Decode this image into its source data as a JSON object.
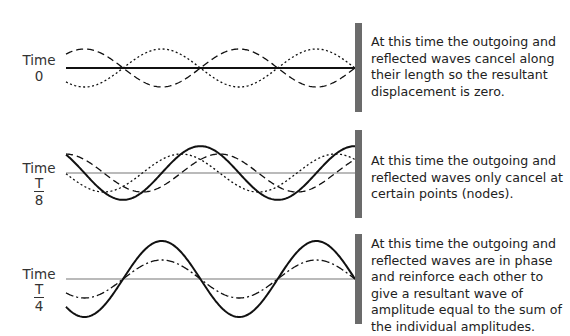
{
  "diagram": {
    "colors": {
      "wall": "#6b6b6b",
      "line": "#111111",
      "axis": "#777777"
    },
    "panels": [
      {
        "id": "t0",
        "time_word": "Time",
        "time_value": "0",
        "description": "At this time the outgoing and reflected waves cancel along their length so the resultant displacement is zero.",
        "curves": [
          "outgoing-wave-dotted",
          "reflected-wave-dashed",
          "resultant-flat-solid"
        ]
      },
      {
        "id": "t8",
        "time_word": "Time",
        "time_num": "T",
        "time_den": "8",
        "description": "At this time the outgoing and reflected waves only cancel at certain points (nodes).",
        "curves": [
          "outgoing-wave-dotted",
          "reflected-wave-dashed",
          "resultant-wave-solid"
        ]
      },
      {
        "id": "t4",
        "time_word": "Time",
        "time_num": "T",
        "time_den": "4",
        "description": "At this time the outgoing and reflected waves are in phase and reinforce each other to give a resultant wave of amplitude equal to the sum of the individual amplitudes.",
        "curves": [
          "component-waves-dashdot",
          "resultant-wave-solid"
        ]
      }
    ]
  }
}
